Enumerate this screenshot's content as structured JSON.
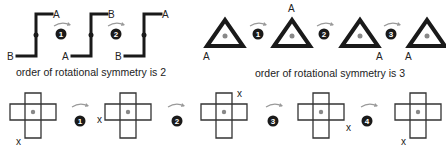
{
  "colors": {
    "stroke": "#1a1a1a",
    "center_dot": "#888888",
    "arrow": "#999999",
    "step_badge": "#1a1a1a"
  },
  "z_shape": {
    "caption": "order of rotational symmetry is 2",
    "order": 2,
    "frames": [
      {
        "top_label": "A",
        "bottom_label": "B"
      },
      {
        "top_label": "B",
        "bottom_label": "A"
      },
      {
        "top_label": "A",
        "bottom_label": "B"
      }
    ],
    "steps": [
      "1",
      "2"
    ]
  },
  "triangle": {
    "caption": "order of rotational symmetry is 3",
    "order": 3,
    "frames": [
      {
        "marker": "A",
        "position": "bottom-left"
      },
      {
        "marker": "A",
        "position": "top"
      },
      {
        "marker": "A",
        "position": "bottom-right"
      },
      {
        "marker": "A",
        "position": "bottom-left"
      }
    ],
    "steps": [
      "1",
      "2",
      "3"
    ]
  },
  "cross": {
    "order": 4,
    "frames": [
      {
        "marker": "x",
        "position": "bottom-left"
      },
      {
        "marker": "x",
        "position": "top-left"
      },
      {
        "marker": "x",
        "position": "top-right"
      },
      {
        "marker": "x",
        "position": "bottom-right"
      },
      {
        "marker": "x",
        "position": "bottom-left"
      }
    ],
    "steps": [
      "1",
      "2",
      "3",
      "4"
    ]
  }
}
